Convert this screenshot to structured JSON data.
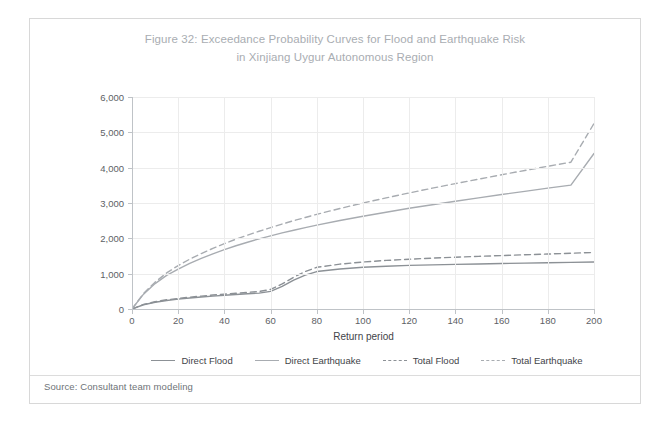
{
  "figure": {
    "title_line1": "Figure 32: Exceedance Probability Curves for Flood and Earthquake Risk",
    "title_line2": "in Xinjiang Uygur Autonomous Region",
    "source": "Source: Consultant team modeling"
  },
  "chart_data": {
    "type": "line",
    "title": "Figure 32: Exceedance Probability Curves for Flood and Earthquake Risk in Xinjiang Uygur Autonomous Region",
    "xlabel": "Return period",
    "ylabel": "Losses ($ million)",
    "xlim": [
      0,
      200
    ],
    "ylim": [
      0,
      6000
    ],
    "xticks": [
      0,
      20,
      40,
      60,
      80,
      100,
      120,
      140,
      160,
      180,
      200
    ],
    "xtick_labels": [
      "0",
      "20",
      "40",
      "60",
      "80",
      "100",
      "120",
      "140",
      "160",
      "180",
      "200"
    ],
    "yticks": [
      0,
      1000,
      2000,
      3000,
      4000,
      5000,
      6000
    ],
    "ytick_labels": [
      "0",
      "1,000",
      "2,000",
      "3,000",
      "4,000",
      "5,000",
      "6,000"
    ],
    "grid": true,
    "legend_position": "bottom",
    "x": [
      0,
      5,
      10,
      15,
      20,
      25,
      30,
      35,
      40,
      45,
      50,
      55,
      60,
      65,
      70,
      75,
      80,
      90,
      100,
      110,
      120,
      130,
      140,
      150,
      160,
      170,
      180,
      190,
      200
    ],
    "series": [
      {
        "name": "Direct Flood",
        "style": "solid",
        "color": "#8c9196",
        "values": [
          0,
          120,
          190,
          240,
          280,
          310,
          340,
          365,
          390,
          410,
          430,
          450,
          500,
          640,
          820,
          960,
          1060,
          1130,
          1180,
          1210,
          1235,
          1250,
          1262,
          1275,
          1287,
          1298,
          1310,
          1320,
          1330
        ]
      },
      {
        "name": "Direct Earthquake",
        "style": "solid",
        "color": "#a8acb1",
        "values": [
          0,
          420,
          720,
          950,
          1130,
          1290,
          1430,
          1560,
          1680,
          1790,
          1890,
          1985,
          2070,
          2155,
          2230,
          2305,
          2375,
          2505,
          2625,
          2740,
          2850,
          2950,
          3050,
          3145,
          3240,
          3330,
          3420,
          3505,
          4400
        ]
      },
      {
        "name": "Total Flood",
        "style": "dashed",
        "color": "#8c9196",
        "values": [
          0,
          130,
          205,
          260,
          300,
          335,
          365,
          395,
          420,
          445,
          470,
          495,
          555,
          710,
          900,
          1060,
          1180,
          1270,
          1330,
          1375,
          1410,
          1440,
          1465,
          1490,
          1512,
          1535,
          1555,
          1578,
          1600
        ]
      },
      {
        "name": "Total Earthquake",
        "style": "dashed",
        "color": "#a8acb1",
        "values": [
          0,
          440,
          760,
          1020,
          1230,
          1410,
          1570,
          1715,
          1850,
          1975,
          2090,
          2200,
          2305,
          2405,
          2500,
          2590,
          2680,
          2845,
          3000,
          3145,
          3285,
          3420,
          3550,
          3675,
          3800,
          3920,
          4040,
          4155,
          5250
        ]
      }
    ]
  },
  "legend": {
    "items": [
      {
        "label": "Direct Flood",
        "style": "solid",
        "color": "#8c9196"
      },
      {
        "label": "Direct Earthquake",
        "style": "solid",
        "color": "#a8acb1"
      },
      {
        "label": "Total Flood",
        "style": "dashed",
        "color": "#8c9196"
      },
      {
        "label": "Total Earthquake",
        "style": "dashed",
        "color": "#a8acb1"
      }
    ]
  }
}
